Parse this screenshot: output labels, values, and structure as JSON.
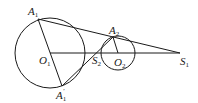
{
  "diagram": {
    "circles": [
      {
        "name": "O1",
        "cx": 50,
        "cy": 53,
        "r": 35
      },
      {
        "name": "O2",
        "cx": 118,
        "cy": 53,
        "r": 17
      }
    ],
    "points": {
      "A1": {
        "x": 38,
        "y": 19
      },
      "A1p": {
        "x": 62,
        "y": 86
      },
      "A2": {
        "x": 113,
        "y": 37
      },
      "O1": {
        "x": 50,
        "y": 53
      },
      "O2": {
        "x": 118,
        "y": 53
      },
      "S1": {
        "x": 180,
        "y": 53
      },
      "S2": {
        "x": 99,
        "y": 53
      }
    },
    "labels": {
      "A1": {
        "main": "A",
        "sub": "1",
        "prime": ""
      },
      "A1p": {
        "main": "A",
        "sub": "1",
        "prime": "′"
      },
      "A2": {
        "main": "A",
        "sub": "2",
        "prime": ""
      },
      "O1": {
        "main": "O",
        "sub": "1",
        "prime": ""
      },
      "O2": {
        "main": "O",
        "sub": "2",
        "prime": ""
      },
      "S1": {
        "main": "S",
        "sub": "1",
        "prime": ""
      },
      "S2": {
        "main": "S",
        "sub": "2",
        "prime": ""
      }
    },
    "segments": [
      [
        "A1",
        "S1"
      ],
      [
        "O1",
        "S1"
      ],
      [
        "A1",
        "A1p"
      ],
      [
        "A1p",
        "A2"
      ],
      [
        "A2",
        "O2"
      ]
    ],
    "stroke_color": "#1a1a1a"
  }
}
